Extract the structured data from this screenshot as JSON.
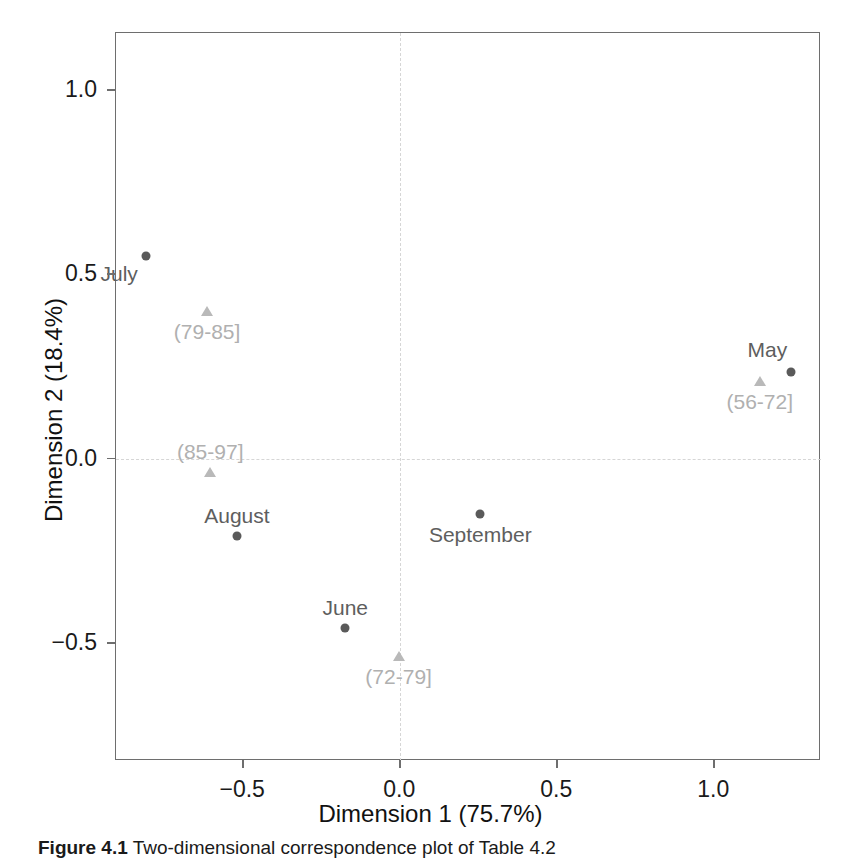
{
  "figure": {
    "caption_label": "Figure 4.1",
    "caption_text": "Two-dimensional correspondence plot of Table 4.2"
  },
  "chart_data": {
    "type": "scatter",
    "title": "",
    "xlabel": "Dimension 1 (75.7%)",
    "ylabel": "Dimension 2 (18.4%)",
    "xlim": [
      -0.905,
      1.34
    ],
    "ylim": [
      -0.82,
      1.155
    ],
    "xticks": [
      "-0.5",
      "0.0",
      "0.5",
      "1.0"
    ],
    "xtick_values": [
      -0.5,
      0.0,
      0.5,
      1.0
    ],
    "yticks": [
      "-0.5",
      "0.0",
      "0.5",
      "1.0"
    ],
    "ytick_values": [
      -0.5,
      0.0,
      0.5,
      1.0
    ],
    "grid": false,
    "legend": "none",
    "reference_lines": {
      "vertical_x": 0.0,
      "horizontal_y": 0.0,
      "style": "dashed",
      "color": "#d6d6d6"
    },
    "series": [
      {
        "name": "Months",
        "marker": "circle",
        "color": "#5a5a5a",
        "points": [
          {
            "label": "July",
            "x": -0.81,
            "y": 0.55,
            "label_pos": "below-left"
          },
          {
            "label": "May",
            "x": 1.245,
            "y": 0.235,
            "label_pos": "above-left"
          },
          {
            "label": "August",
            "x": -0.52,
            "y": -0.21,
            "label_pos": "above"
          },
          {
            "label": "September",
            "x": 0.255,
            "y": -0.15,
            "label_pos": "below"
          },
          {
            "label": "June",
            "x": -0.175,
            "y": -0.46,
            "label_pos": "above"
          }
        ]
      },
      {
        "name": "Age groups",
        "marker": "triangle",
        "color": "#b9b9b9",
        "points": [
          {
            "label": "(79-85]",
            "x": -0.615,
            "y": 0.4,
            "label_pos": "below"
          },
          {
            "label": "(56-72]",
            "x": 1.145,
            "y": 0.21,
            "label_pos": "below"
          },
          {
            "label": "(85-97]",
            "x": -0.605,
            "y": -0.035,
            "label_pos": "above"
          },
          {
            "label": "(72-79]",
            "x": -0.005,
            "y": -0.535,
            "label_pos": "below"
          }
        ]
      }
    ]
  }
}
